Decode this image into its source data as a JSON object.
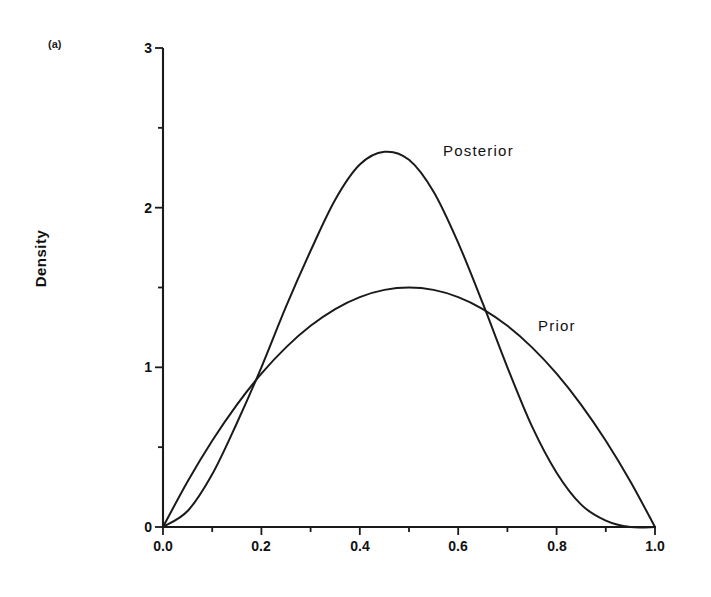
{
  "figure": {
    "panel_label": "(a)",
    "ylabel": "Density",
    "background": "#ffffff",
    "ink": "#1a1a1a"
  },
  "annotations": {
    "posterior_label": "Posterior",
    "prior_label": "Prior"
  },
  "chart_data": {
    "type": "line",
    "title": "",
    "subtitle": "",
    "xlabel": "",
    "ylabel": "Density",
    "panel": "(a)",
    "xlim": [
      0.0,
      1.0
    ],
    "ylim": [
      0,
      3
    ],
    "grid": false,
    "legend": "inline-annotations",
    "xticks": [
      0.0,
      0.2,
      0.4,
      0.6,
      0.8,
      1.0
    ],
    "xtick_labels": [
      "0.0",
      "0.2",
      "0.4",
      "0.6",
      "0.8",
      "1.0"
    ],
    "xminor_ticks": [
      0.1,
      0.3,
      0.5,
      0.7,
      0.9
    ],
    "yticks": [
      0,
      1,
      2,
      3
    ],
    "ytick_labels": [
      "0",
      "1",
      "2",
      "3"
    ],
    "yminor_ticks": [
      0.5,
      1.5,
      2.5
    ],
    "annotations": [
      {
        "text": "Posterior",
        "x": 0.565,
        "y": 2.3
      },
      {
        "text": "Prior",
        "x": 0.8,
        "y": 1.3
      }
    ],
    "series": [
      {
        "name": "Prior",
        "distribution": "Beta(2, 2)",
        "peak_x": 0.5,
        "peak_y": 1.5,
        "x": [
          0.0,
          0.05,
          0.1,
          0.15,
          0.2,
          0.25,
          0.3,
          0.35,
          0.4,
          0.45,
          0.5,
          0.55,
          0.6,
          0.65,
          0.7,
          0.75,
          0.8,
          0.85,
          0.9,
          0.95,
          1.0
        ],
        "values": [
          0.0,
          0.285,
          0.54,
          0.765,
          0.96,
          1.125,
          1.26,
          1.365,
          1.44,
          1.485,
          1.5,
          1.485,
          1.44,
          1.365,
          1.26,
          1.125,
          0.96,
          0.765,
          0.54,
          0.285,
          0.0
        ]
      },
      {
        "name": "Posterior",
        "distribution": "Beta(3.3, 4.3)",
        "peak_x": 0.42,
        "peak_y": 2.35,
        "x": [
          0.0,
          0.05,
          0.1,
          0.15,
          0.2,
          0.25,
          0.3,
          0.35,
          0.4,
          0.45,
          0.5,
          0.55,
          0.6,
          0.65,
          0.7,
          0.75,
          0.8,
          0.85,
          0.9,
          0.95,
          1.0
        ],
        "values": [
          0.0,
          0.1,
          0.33,
          0.65,
          1.0,
          1.38,
          1.73,
          2.05,
          2.27,
          2.35,
          2.3,
          2.1,
          1.78,
          1.4,
          1.0,
          0.63,
          0.34,
          0.14,
          0.04,
          0.0,
          0.0
        ]
      }
    ],
    "intersections": [
      {
        "x": 0.21,
        "y": 1.0
      },
      {
        "x": 0.63,
        "y": 1.38
      }
    ]
  }
}
